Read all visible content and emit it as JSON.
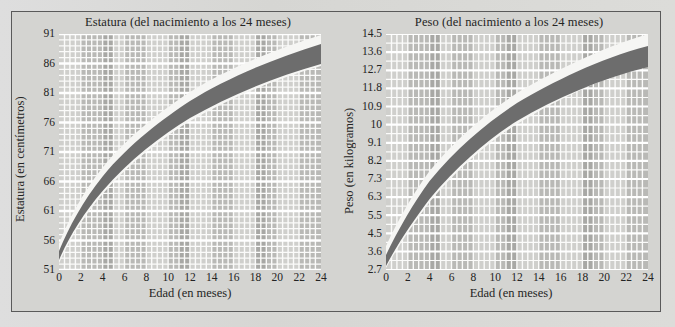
{
  "figure": {
    "background_color": "#d8d8d5",
    "frame_color": "#5a5a5a"
  },
  "charts": [
    {
      "id": "estatura",
      "title": "Estatura (del nacimiento a los 24 meses)",
      "xlabel": "Edad (en meses)",
      "ylabel": "Estatura (en centímetros)",
      "yticks": [
        "91",
        "86",
        "81",
        "76",
        "71",
        "66",
        "61",
        "56",
        "51"
      ],
      "xticks": [
        "0",
        "2",
        "4",
        "6",
        "8",
        "10",
        "12",
        "14",
        "16",
        "18",
        "20",
        "22",
        "24"
      ]
    },
    {
      "id": "peso",
      "title": "Peso (del nacimiento a los 24 meses)",
      "xlabel": "Edad (en meses)",
      "ylabel": "Peso (en kilogramos)",
      "yticks": [
        "14.5",
        "13.6",
        "12.7",
        "11.8",
        "10.9",
        "10",
        "9.1",
        "8.2",
        "7.3",
        "6.3",
        "5.5",
        "4.5",
        "3.6",
        "2.7"
      ],
      "xticks": [
        "0",
        "2",
        "4",
        "6",
        "8",
        "10",
        "12",
        "14",
        "16",
        "18",
        "20",
        "22",
        "24"
      ]
    }
  ],
  "chart_data": [
    {
      "type": "area",
      "title": "Estatura (del nacimiento a los 24 meses)",
      "xlabel": "Edad (en meses)",
      "ylabel": "Estatura (en centímetros)",
      "xlim": [
        0,
        24
      ],
      "ylim": [
        51,
        91
      ],
      "ytick_values": [
        51,
        56,
        61,
        66,
        71,
        76,
        81,
        86,
        91
      ],
      "xtick_values": [
        0,
        2,
        4,
        6,
        8,
        10,
        12,
        14,
        16,
        18,
        20,
        22,
        24
      ],
      "grid": true,
      "legend": "none",
      "band_colors": {
        "inner": "#6a6a6a",
        "outer": "#f4f4f2"
      },
      "x": [
        0,
        2,
        4,
        6,
        8,
        10,
        12,
        14,
        16,
        18,
        20,
        22,
        24
      ],
      "series": [
        {
          "name": "percentil superior (banda externa clara, borde superior)",
          "values": [
            55.5,
            63.2,
            68.5,
            72.5,
            75.8,
            78.6,
            81.0,
            83.2,
            85.2,
            87.0,
            88.6,
            90.1,
            91.5
          ]
        },
        {
          "name": "percentil alto (banda oscura, borde superior)",
          "values": [
            54.2,
            61.6,
            66.7,
            70.6,
            73.8,
            76.6,
            79.0,
            81.1,
            83.0,
            84.8,
            86.4,
            87.9,
            89.3
          ]
        },
        {
          "name": "percentil bajo (banda oscura, borde inferior)",
          "values": [
            52.4,
            59.2,
            63.9,
            67.5,
            70.5,
            73.1,
            75.4,
            77.4,
            79.3,
            81.0,
            82.6,
            84.0,
            85.4
          ]
        },
        {
          "name": "percentil inferior (banda externa clara, borde inferior)",
          "values": [
            51.0,
            57.6,
            62.0,
            65.5,
            68.4,
            70.9,
            73.1,
            75.1,
            76.9,
            78.6,
            80.2,
            81.6,
            83.0
          ]
        }
      ]
    },
    {
      "type": "area",
      "title": "Peso (del nacimiento a los 24 meses)",
      "xlabel": "Edad (en meses)",
      "ylabel": "Peso (en kilogramos)",
      "xlim": [
        0,
        24
      ],
      "ylim": [
        2.7,
        14.5
      ],
      "ytick_values": [
        2.7,
        3.6,
        4.5,
        5.5,
        6.3,
        7.3,
        8.2,
        9.1,
        10,
        10.9,
        11.8,
        12.7,
        13.6,
        14.5
      ],
      "xtick_values": [
        0,
        2,
        4,
        6,
        8,
        10,
        12,
        14,
        16,
        18,
        20,
        22,
        24
      ],
      "grid": true,
      "legend": "none",
      "band_colors": {
        "inner": "#6a6a6a",
        "outer": "#f4f4f2"
      },
      "x": [
        0,
        2,
        4,
        6,
        8,
        10,
        12,
        14,
        16,
        18,
        20,
        22,
        24
      ],
      "series": [
        {
          "name": "percentil superior (banda externa clara, borde superior)",
          "values": [
            4.0,
            6.4,
            8.0,
            9.2,
            10.2,
            11.0,
            11.7,
            12.4,
            13.0,
            13.5,
            14.0,
            14.3,
            14.6
          ]
        },
        {
          "name": "percentil alto (banda oscura, borde superior)",
          "values": [
            3.7,
            5.9,
            7.4,
            8.5,
            9.4,
            10.2,
            10.8,
            11.4,
            11.9,
            12.4,
            12.8,
            13.1,
            13.4
          ]
        },
        {
          "name": "percentil bajo (banda oscura, borde inferior)",
          "values": [
            3.2,
            5.1,
            6.4,
            7.4,
            8.2,
            8.9,
            9.5,
            10.0,
            10.5,
            10.9,
            11.3,
            11.6,
            11.9
          ]
        },
        {
          "name": "percentil inferior (banda externa clara, borde inferior)",
          "values": [
            2.7,
            4.4,
            5.6,
            6.5,
            7.2,
            7.8,
            8.4,
            8.9,
            9.3,
            9.7,
            10.1,
            10.4,
            10.7
          ]
        }
      ]
    }
  ]
}
